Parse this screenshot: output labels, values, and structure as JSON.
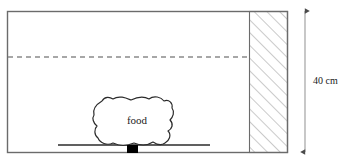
{
  "diagram": {
    "container": {
      "name": "container-box",
      "x": 7,
      "y": 11,
      "width": 280,
      "height": 141,
      "stroke_color": "#6b6b6b",
      "fill_color": "#ffffff"
    },
    "hatched_wall": {
      "name": "hatched-wall",
      "x": 249,
      "y": 11,
      "width": 38,
      "height": 141,
      "stroke_color": "#8a8a8a",
      "hatch_spacing": 9,
      "hatch_direction": "lower-left-to-upper-right"
    },
    "dashed_line": {
      "name": "water-level-dashed-line",
      "y": 57,
      "x_start": 8,
      "x_end": 249,
      "stroke_color": "#8a8a8a",
      "dash_pattern": "5,4"
    },
    "shelf_line": {
      "name": "shelf-line",
      "y": 145,
      "x_start": 58,
      "x_end": 210,
      "stroke_color": "#2b2b2b"
    },
    "black_square": {
      "name": "support-block",
      "x": 127,
      "y": 145,
      "width": 11,
      "height": 8,
      "fill_color": "#000000"
    },
    "food_blob": {
      "name": "food-blob",
      "label": "food",
      "label_x": 137,
      "label_y": 124,
      "stroke_color": "#2b2b2b",
      "fill_color": "#ffffff",
      "path": "M 94 115 C 92 108 97 104 102 101 C 105 96 110 97 113 99 C 119 95 126 98 131 100 C 137 97 144 96 149 99 C 154 95 161 97 164 101 C 169 99 173 103 172 108 C 175 112 173 117 170 120 C 174 124 172 129 168 131 C 172 135 169 141 165 143 C 161 146 156 144 153 142 C 147 146 139 145 134 143 C 127 146 119 146 113 143 C 107 146 100 143 98 138 C 94 135 94 129 97 126 C 93 123 92 118 94 115 Z"
    },
    "dimension": {
      "name": "height-dimension",
      "label": "40 cm",
      "x": 305,
      "y_top": 11,
      "y_bottom": 152,
      "stroke_color": "#4a4a4a",
      "label_x": 313,
      "label_y": 84
    }
  }
}
